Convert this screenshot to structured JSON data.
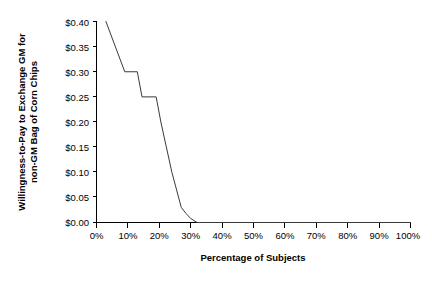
{
  "chart_data": {
    "type": "line",
    "title": "",
    "xlabel": "Percentage of Subjects",
    "ylabel": "Willingness-to-Pay to Exchange GM for non-GM Bag of Corn Chips",
    "ylabel_line1": "Willingness-to-Pay to Exchange GM for",
    "ylabel_line2": "non-GM Bag of Corn Chips",
    "xlim": [
      0,
      100
    ],
    "ylim": [
      0,
      0.4
    ],
    "grid": false,
    "legend": false,
    "legend_position": "none",
    "line_color": "#3a3a3a",
    "axis_color": "#000000",
    "background_color": "#ffffff",
    "xticks": [
      0,
      10,
      20,
      30,
      40,
      50,
      60,
      70,
      80,
      90,
      100
    ],
    "xtick_labels": [
      "0%",
      "10%",
      "20%",
      "30%",
      "40%",
      "50%",
      "60%",
      "70%",
      "80%",
      "90%",
      "100%"
    ],
    "yticks": [
      0.0,
      0.05,
      0.1,
      0.15,
      0.2,
      0.25,
      0.3,
      0.35,
      0.4
    ],
    "ytick_labels": [
      "$0.00",
      "$0.05",
      "$0.10",
      "$0.15",
      "$0.20",
      "$0.25",
      "$0.30",
      "$0.35",
      "$0.40"
    ],
    "series": [
      {
        "name": "Willingness-to-Pay",
        "x": [
          3.0,
          9.0,
          13.0,
          14.5,
          19.0,
          20.5,
          24.0,
          27.0,
          28.5,
          30.0,
          32.0,
          100.0
        ],
        "values": [
          0.4,
          0.3,
          0.3,
          0.25,
          0.25,
          0.2,
          0.1,
          0.03,
          0.018,
          0.008,
          0.0,
          0.0
        ]
      }
    ]
  }
}
